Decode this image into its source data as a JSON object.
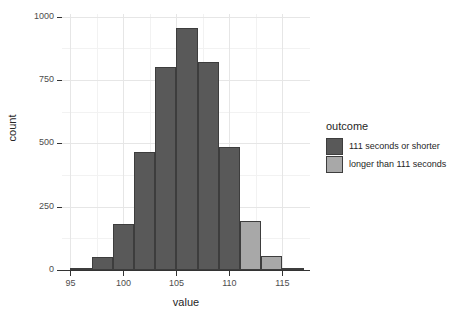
{
  "chart_data": {
    "type": "bar",
    "title": "",
    "subtitle": "",
    "xlabel": "value",
    "ylabel": "count",
    "xlim": [
      94.2,
      117.6
    ],
    "ylim": [
      0,
      1010
    ],
    "grid": true,
    "legend_position": "right",
    "x_ticks": [
      95,
      100,
      105,
      110,
      115
    ],
    "x_tick_labels": [
      "95",
      "100",
      "105",
      "110",
      "115"
    ],
    "y_ticks": [
      0,
      250,
      500,
      750,
      1000
    ],
    "y_tick_labels": [
      "0",
      "250",
      "500",
      "750",
      "1000"
    ],
    "x_minor_ticks": [
      97.5,
      102.5,
      107.5,
      112.5
    ],
    "y_minor_ticks": [
      125,
      375,
      625,
      875
    ],
    "bin_width": 2,
    "bins": [
      {
        "x_start": 95,
        "x_end": 97,
        "count": 5,
        "series": "111 seconds or shorter"
      },
      {
        "x_start": 97,
        "x_end": 99,
        "count": 50,
        "series": "111 seconds or shorter"
      },
      {
        "x_start": 99,
        "x_end": 101,
        "count": 180,
        "series": "111 seconds or shorter"
      },
      {
        "x_start": 101,
        "x_end": 103,
        "count": 465,
        "series": "111 seconds or shorter"
      },
      {
        "x_start": 103,
        "x_end": 105,
        "count": 800,
        "series": "111 seconds or shorter"
      },
      {
        "x_start": 105,
        "x_end": 107,
        "count": 955,
        "series": "111 seconds or shorter"
      },
      {
        "x_start": 107,
        "x_end": 109,
        "count": 820,
        "series": "111 seconds or shorter"
      },
      {
        "x_start": 109,
        "x_end": 111,
        "count": 485,
        "series": "111 seconds or shorter"
      },
      {
        "x_start": 111,
        "x_end": 113,
        "count": 195,
        "series": "longer than 111 seconds"
      },
      {
        "x_start": 113,
        "x_end": 115,
        "count": 55,
        "series": "longer than 111 seconds"
      },
      {
        "x_start": 115,
        "x_end": 117,
        "count": 5,
        "series": "longer than 111 seconds"
      }
    ],
    "series": [
      {
        "name": "111 seconds or shorter",
        "color": "#595959"
      },
      {
        "name": "longer than 111 seconds",
        "color": "#a8a8a8"
      }
    ]
  },
  "legend": {
    "title": "outcome",
    "items": [
      {
        "label": "111 seconds or shorter",
        "color": "#595959"
      },
      {
        "label": "longer than 111 seconds",
        "color": "#a8a8a8"
      }
    ]
  },
  "style": {
    "bar_outline": "#3d3d3d",
    "grid_major": "#e6e6e6",
    "grid_minor": "#f2f2f2",
    "axis_color": "#333333",
    "panel_background": "#ffffff"
  }
}
